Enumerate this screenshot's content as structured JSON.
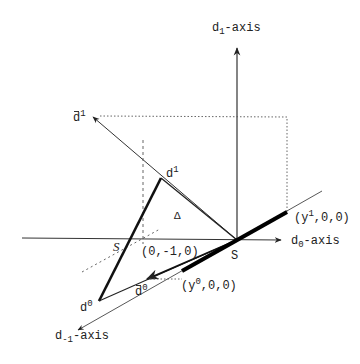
{
  "diagram": {
    "axes": {
      "d1": {
        "base": "d",
        "sub": "1",
        "suffix": "-axis"
      },
      "d0": {
        "base": "d",
        "sub": "0",
        "suffix": "-axis"
      },
      "dminus1": {
        "base": "d",
        "sub": "-1",
        "suffix": "-axis"
      }
    },
    "points": {
      "dbar1": {
        "base": "d",
        "sup": "1"
      },
      "d1": {
        "base": "d",
        "sup": "1"
      },
      "d0": {
        "base": "d",
        "sup": "0"
      },
      "dbar0": {
        "base": "d",
        "sup": "0"
      },
      "origin": "S",
      "s_left": "S",
      "delta": "Δ",
      "y1_point": {
        "open": "(y",
        "sup": "1",
        "rest": ",0,0)"
      },
      "y0_point": {
        "open": "(y",
        "sup": "0",
        "rest": ",0,0)"
      },
      "neg_unit": "(0,-1,0)"
    },
    "colors": {
      "ink": "#222222",
      "background": "#ffffff"
    }
  }
}
